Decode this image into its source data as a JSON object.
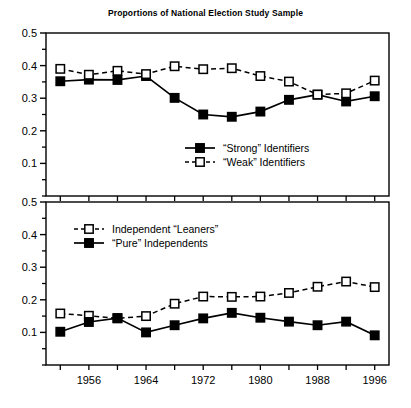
{
  "figure": {
    "title": "Proportions of National Election Study Sample",
    "colors": {
      "ink": "#000000",
      "background": "#ffffff",
      "marker_fill_open": "#ffffff"
    }
  },
  "chart_data": [
    {
      "type": "line",
      "panel": "top",
      "title": "Proportions of National Election Study Sample",
      "xlabel": "",
      "ylabel": "",
      "x": [
        1952,
        1956,
        1960,
        1964,
        1968,
        1972,
        1976,
        1980,
        1984,
        1988,
        1992,
        1996
      ],
      "xtick_values": [
        1956,
        1964,
        1972,
        1980,
        1988,
        1996
      ],
      "xtick_labels": [
        "1956",
        "1964",
        "1972",
        "1980",
        "1988",
        "1996"
      ],
      "ytick_values": [
        0.1,
        0.2,
        0.3,
        0.4,
        0.5
      ],
      "ytick_labels": [
        "0.1",
        "0.2",
        "0.3",
        "0.4",
        "0.5"
      ],
      "yminor_values": [
        0.05,
        0.15,
        0.25,
        0.35,
        0.45
      ],
      "ylim": [
        0.0,
        0.5
      ],
      "xlim": [
        1950,
        1998
      ],
      "grid": false,
      "legend_position": "center-bottom",
      "series": [
        {
          "name": "“Strong” Identifiers",
          "marker": "filled-square",
          "linestyle": "solid",
          "values": [
            0.352,
            0.357,
            0.356,
            0.368,
            0.301,
            0.25,
            0.243,
            0.259,
            0.295,
            0.311,
            0.29,
            0.306
          ]
        },
        {
          "name": "“Weak” Identifiers",
          "marker": "open-square",
          "linestyle": "dashed",
          "values": [
            0.39,
            0.372,
            0.384,
            0.374,
            0.398,
            0.389,
            0.392,
            0.368,
            0.351,
            0.311,
            0.315,
            0.354
          ]
        }
      ]
    },
    {
      "type": "line",
      "panel": "bottom",
      "title": "",
      "xlabel": "",
      "ylabel": "",
      "x": [
        1952,
        1956,
        1960,
        1964,
        1968,
        1972,
        1976,
        1980,
        1984,
        1988,
        1992,
        1996
      ],
      "xtick_values": [
        1956,
        1964,
        1972,
        1980,
        1988,
        1996
      ],
      "xtick_labels": [
        "1956",
        "1964",
        "1972",
        "1980",
        "1988",
        "1996"
      ],
      "ytick_values": [
        0.1,
        0.2,
        0.3,
        0.4,
        0.5
      ],
      "ytick_labels": [
        "0.1",
        "0.2",
        "0.3",
        "0.4",
        "0.5"
      ],
      "yminor_values": [
        0.05,
        0.15,
        0.25,
        0.35,
        0.45
      ],
      "ylim": [
        0.0,
        0.5
      ],
      "xlim": [
        1950,
        1998
      ],
      "grid": false,
      "legend_position": "top-left",
      "series": [
        {
          "name": "Independent “Leaners”",
          "marker": "open-square",
          "linestyle": "dashed",
          "values": [
            0.158,
            0.151,
            0.143,
            0.15,
            0.188,
            0.21,
            0.209,
            0.21,
            0.221,
            0.24,
            0.256,
            0.239
          ]
        },
        {
          "name": "“Pure” Independents",
          "marker": "filled-square",
          "linestyle": "solid",
          "values": [
            0.102,
            0.132,
            0.144,
            0.1,
            0.122,
            0.143,
            0.16,
            0.145,
            0.133,
            0.122,
            0.133,
            0.091
          ]
        }
      ]
    }
  ]
}
